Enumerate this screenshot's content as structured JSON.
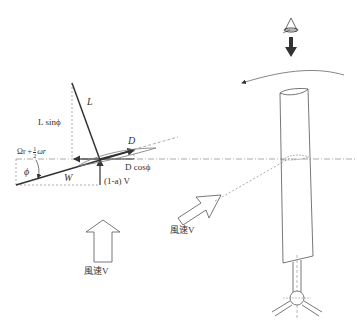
{
  "diagram": {
    "labels": {
      "lift": "L",
      "lift_vertical": "L sinϕ",
      "drag": "D",
      "drag_horizontal": "D cosϕ",
      "relative_wind": "W",
      "angle": "ϕ",
      "rotational_speed_prefix": "Ωr +",
      "rotational_speed_frac_num": "1",
      "rotational_speed_frac_den": "2",
      "rotational_speed_suffix": "ωr",
      "axial_velocity": "(1-a) V",
      "wind_speed_bottom": "風速V",
      "wind_speed_right": "風速V"
    },
    "colors": {
      "line": "#333333",
      "dashed": "#888888",
      "background": "#ffffff"
    }
  }
}
